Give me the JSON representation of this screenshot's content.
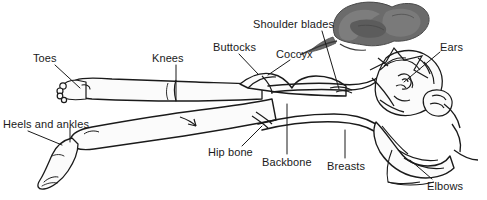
{
  "figure": {
    "background_color": "#ffffff",
    "ink_color": "#1a1a1a",
    "pillow_color": "#6b6b6b",
    "pillow_shadow_color": "#8d8d8d",
    "skin_fill": "#fbfbfb"
  },
  "labels": [
    {
      "id": "toes",
      "text": "Toes",
      "x": 33,
      "y": 52,
      "leader": [
        [
          55,
          65
        ],
        [
          80,
          88
        ]
      ]
    },
    {
      "id": "knees",
      "text": "Knees",
      "x": 152,
      "y": 52,
      "leader": [
        [
          176,
          65
        ],
        [
          176,
          101
        ]
      ]
    },
    {
      "id": "buttocks",
      "text": "Buttocks",
      "x": 213,
      "y": 41,
      "leader": [
        [
          239,
          54
        ],
        [
          258,
          74
        ]
      ]
    },
    {
      "id": "coccyx",
      "text": "Coccyx",
      "x": 276,
      "y": 48,
      "leader": [
        [
          290,
          60
        ],
        [
          268,
          75
        ]
      ]
    },
    {
      "id": "shoulder-blades",
      "text": "Shoulder blades",
      "x": 253,
      "y": 18,
      "leader": [
        [
          322,
          31
        ],
        [
          339,
          89
        ]
      ]
    },
    {
      "id": "ears",
      "text": "Ears",
      "x": 440,
      "y": 41,
      "leader": [
        [
          440,
          52
        ],
        [
          404,
          82
        ]
      ]
    },
    {
      "id": "heels-and-ankles",
      "text": "Heels and ankles",
      "x": 3,
      "y": 118,
      "leader": [
        [
          28,
          131
        ],
        [
          62,
          145
        ]
      ],
      "leader2": [
        [
          70,
          128
        ],
        [
          70,
          142
        ]
      ]
    },
    {
      "id": "hip-bone",
      "text": "Hip bone",
      "x": 208,
      "y": 146,
      "leader": [
        [
          242,
          146
        ],
        [
          262,
          126
        ]
      ]
    },
    {
      "id": "backbone",
      "text": "Backbone",
      "x": 262,
      "y": 156,
      "leader": [
        [
          287,
          154
        ],
        [
          287,
          104
        ]
      ]
    },
    {
      "id": "breasts",
      "text": "Breasts",
      "x": 327,
      "y": 160,
      "leader": [
        [
          345,
          158
        ],
        [
          345,
          130
        ]
      ]
    },
    {
      "id": "elbows",
      "text": "Elbows",
      "x": 427,
      "y": 180,
      "leader": [
        [
          432,
          179
        ],
        [
          410,
          160
        ]
      ]
    }
  ]
}
